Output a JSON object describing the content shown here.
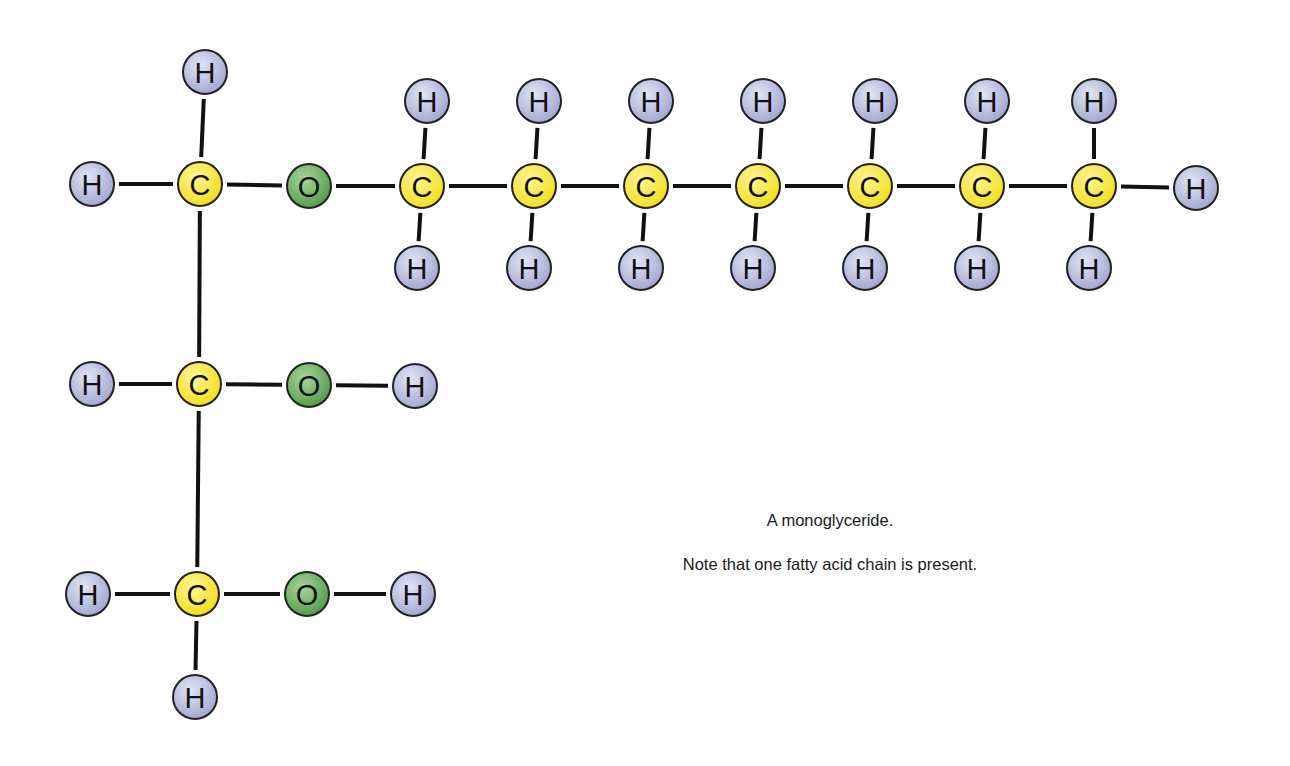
{
  "title": "A monoglyceride.",
  "note": "Note that one fatty acid chain is present.",
  "colors": {
    "H": [
      "#dfe6f5",
      "#9ea4cf"
    ],
    "C": [
      "#fff59a",
      "#f3dc12"
    ],
    "O": [
      "#a9d49b",
      "#4f9a45"
    ],
    "bond": "#111111",
    "outline": "#222222"
  },
  "atoms": [
    {
      "id": "H1",
      "el": "H",
      "pos": [
        205,
        72
      ]
    },
    {
      "id": "H2",
      "el": "H",
      "pos": [
        92,
        184
      ]
    },
    {
      "id": "C1",
      "el": "C",
      "pos": [
        200,
        184
      ]
    },
    {
      "id": "O1",
      "el": "O",
      "pos": [
        309,
        186
      ]
    },
    {
      "id": "H3",
      "el": "H",
      "pos": [
        92,
        384
      ]
    },
    {
      "id": "C2",
      "el": "C",
      "pos": [
        199,
        384
      ]
    },
    {
      "id": "O2",
      "el": "O",
      "pos": [
        309,
        385
      ]
    },
    {
      "id": "H4",
      "el": "H",
      "pos": [
        415,
        386
      ]
    },
    {
      "id": "H5",
      "el": "H",
      "pos": [
        88,
        594
      ]
    },
    {
      "id": "C3",
      "el": "C",
      "pos": [
        197,
        594
      ]
    },
    {
      "id": "O3",
      "el": "O",
      "pos": [
        307,
        594
      ]
    },
    {
      "id": "H6",
      "el": "H",
      "pos": [
        413,
        594
      ]
    },
    {
      "id": "H7",
      "el": "H",
      "pos": [
        195,
        697
      ]
    },
    {
      "id": "CA1",
      "el": "C",
      "pos": [
        422,
        186
      ]
    },
    {
      "id": "CA2",
      "el": "C",
      "pos": [
        534,
        186
      ]
    },
    {
      "id": "CA3",
      "el": "C",
      "pos": [
        646,
        186
      ]
    },
    {
      "id": "CA4",
      "el": "C",
      "pos": [
        758,
        186
      ]
    },
    {
      "id": "CA5",
      "el": "C",
      "pos": [
        870,
        186
      ]
    },
    {
      "id": "CA6",
      "el": "C",
      "pos": [
        982,
        186
      ]
    },
    {
      "id": "CA7",
      "el": "C",
      "pos": [
        1094,
        186
      ]
    },
    {
      "id": "HT1",
      "el": "H",
      "pos": [
        427,
        101
      ]
    },
    {
      "id": "HT2",
      "el": "H",
      "pos": [
        539,
        101
      ]
    },
    {
      "id": "HT3",
      "el": "H",
      "pos": [
        651,
        101
      ]
    },
    {
      "id": "HT4",
      "el": "H",
      "pos": [
        763,
        101
      ]
    },
    {
      "id": "HT5",
      "el": "H",
      "pos": [
        875,
        101
      ]
    },
    {
      "id": "HT6",
      "el": "H",
      "pos": [
        987,
        101
      ]
    },
    {
      "id": "HT7",
      "el": "H",
      "pos": [
        1094,
        101
      ]
    },
    {
      "id": "HB1",
      "el": "H",
      "pos": [
        417,
        268
      ]
    },
    {
      "id": "HB2",
      "el": "H",
      "pos": [
        529,
        268
      ]
    },
    {
      "id": "HB3",
      "el": "H",
      "pos": [
        641,
        268
      ]
    },
    {
      "id": "HB4",
      "el": "H",
      "pos": [
        753,
        268
      ]
    },
    {
      "id": "HB5",
      "el": "H",
      "pos": [
        865,
        268
      ]
    },
    {
      "id": "HB6",
      "el": "H",
      "pos": [
        977,
        268
      ]
    },
    {
      "id": "HB7",
      "el": "H",
      "pos": [
        1089,
        268
      ]
    },
    {
      "id": "HE",
      "el": "H",
      "pos": [
        1196,
        188
      ]
    }
  ],
  "bonds": [
    [
      "H1",
      "C1"
    ],
    [
      "H2",
      "C1"
    ],
    [
      "C1",
      "O1"
    ],
    [
      "C1",
      "C2"
    ],
    [
      "H3",
      "C2"
    ],
    [
      "C2",
      "O2"
    ],
    [
      "O2",
      "H4"
    ],
    [
      "C2",
      "C3"
    ],
    [
      "H5",
      "C3"
    ],
    [
      "C3",
      "O3"
    ],
    [
      "O3",
      "H6"
    ],
    [
      "C3",
      "H7"
    ],
    [
      "O1",
      "CA1"
    ],
    [
      "CA1",
      "CA2"
    ],
    [
      "CA2",
      "CA3"
    ],
    [
      "CA3",
      "CA4"
    ],
    [
      "CA4",
      "CA5"
    ],
    [
      "CA5",
      "CA6"
    ],
    [
      "CA6",
      "CA7"
    ],
    [
      "CA7",
      "HE"
    ],
    [
      "CA1",
      "HT1"
    ],
    [
      "CA2",
      "HT2"
    ],
    [
      "CA3",
      "HT3"
    ],
    [
      "CA4",
      "HT4"
    ],
    [
      "CA5",
      "HT5"
    ],
    [
      "CA6",
      "HT6"
    ],
    [
      "CA7",
      "HT7"
    ],
    [
      "CA1",
      "HB1"
    ],
    [
      "CA2",
      "HB2"
    ],
    [
      "CA3",
      "HB3"
    ],
    [
      "CA4",
      "HB4"
    ],
    [
      "CA5",
      "HB5"
    ],
    [
      "CA6",
      "HB6"
    ],
    [
      "CA7",
      "HB7"
    ]
  ]
}
